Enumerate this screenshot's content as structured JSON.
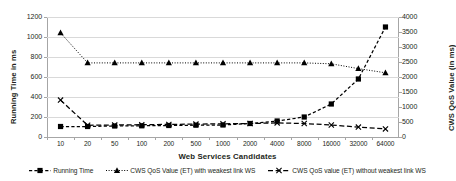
{
  "chart_data": {
    "type": "line",
    "title": "",
    "xlabel": "Web Services Candidates",
    "ylabel": "Running Time in ms",
    "ylabel_secondary": "CWS QoS Value (in ms)",
    "categories": [
      "10",
      "20",
      "50",
      "100",
      "200",
      "500",
      "1000",
      "2000",
      "4000",
      "8000",
      "16000",
      "32000",
      "64000"
    ],
    "ylim": [
      0,
      1200
    ],
    "ylim_secondary": [
      0,
      4000
    ],
    "yticks": [
      "0",
      "200",
      "400",
      "600",
      "800",
      "1000",
      "1200"
    ],
    "yticks_secondary": [
      "0",
      "500",
      "1000",
      "1500",
      "2000",
      "2500",
      "3000",
      "3500",
      "4000"
    ],
    "grid": true,
    "legend_position": "bottom",
    "series": [
      {
        "name": "Running Time",
        "axis": "left",
        "marker": "square",
        "line": "dashed",
        "values": [
          105,
          105,
          110,
          112,
          115,
          118,
          120,
          135,
          160,
          200,
          330,
          580,
          1100
        ]
      },
      {
        "name": "CWS QoS Value (ET) with weakest link WS",
        "axis": "right",
        "marker": "triangle",
        "line": "dotted",
        "values": [
          3470,
          2470,
          2470,
          2470,
          2470,
          2470,
          2470,
          2470,
          2470,
          2470,
          2440,
          2280,
          2140
        ]
      },
      {
        "name": "CWS QoS value (ET) without weakest link WS",
        "axis": "right",
        "marker": "x",
        "line": "long-dashed",
        "values": [
          1230,
          390,
          400,
          410,
          420,
          430,
          440,
          450,
          470,
          450,
          400,
          330,
          270
        ]
      }
    ]
  },
  "legend": {
    "items": [
      {
        "label": "Running Time",
        "marker": "square",
        "icon": "legend-key-square-dashed"
      },
      {
        "label": "CWS QoS Value (ET) with weakest link WS",
        "marker": "triangle",
        "icon": "legend-key-triangle-dotted"
      },
      {
        "label": "CWS QoS value (ET) without weakest link WS",
        "marker": "x",
        "icon": "legend-key-x-dashed"
      }
    ]
  }
}
